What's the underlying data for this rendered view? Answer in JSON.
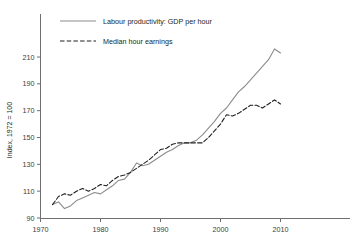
{
  "chart_data": {
    "type": "line",
    "title": "",
    "subtitle": "",
    "xlabel": "",
    "ylabel": "Index, 1972 = 100",
    "xlim": [
      1970,
      2016
    ],
    "ylim": [
      90,
      222
    ],
    "xticks": [
      "1970",
      "1980",
      "1990",
      "2000",
      "2010"
    ],
    "xtick_values": [
      1970,
      1980,
      1990,
      2000,
      2010
    ],
    "yticks": [
      "90",
      "110",
      "130",
      "150",
      "170",
      "190",
      "210"
    ],
    "ytick_values": [
      90,
      110,
      130,
      150,
      170,
      190,
      210
    ],
    "grid": false,
    "legend_position": "top-left-inside",
    "colors": {
      "productivity": "#8c8c8c",
      "earnings": "#231f20",
      "axis": "#6f6f6f",
      "background": "#ffffff"
    },
    "series": [
      {
        "name": "Labour productivity: GDP per hour",
        "style": "solid",
        "color": "#8c8c8c",
        "x": [
          1972,
          1973,
          1974,
          1975,
          1976,
          1977,
          1978,
          1979,
          1980,
          1981,
          1982,
          1983,
          1984,
          1985,
          1986,
          1987,
          1988,
          1989,
          1990,
          1991,
          1992,
          1993,
          1994,
          1995,
          1996,
          1997,
          1998,
          1999,
          2000,
          2001,
          2002,
          2003,
          2004,
          2005,
          2006,
          2007,
          2008,
          2009,
          2010
        ],
        "values": [
          100,
          102,
          97,
          99,
          103,
          105,
          107,
          109,
          108,
          111,
          114,
          118,
          119,
          124,
          131,
          129,
          130,
          133,
          136,
          139,
          141,
          144,
          146,
          146,
          148,
          152,
          157,
          162,
          168,
          172,
          178,
          184,
          188,
          193,
          198,
          203,
          208,
          216,
          213
        ]
      },
      {
        "name": "Median hour earnings",
        "style": "dashed",
        "color": "#231f20",
        "x": [
          1972,
          1973,
          1974,
          1975,
          1976,
          1977,
          1978,
          1979,
          1980,
          1981,
          1982,
          1983,
          1984,
          1985,
          1986,
          1987,
          1988,
          1989,
          1990,
          1991,
          1992,
          1993,
          1994,
          1995,
          1996,
          1997,
          1998,
          1999,
          2000,
          2001,
          2002,
          2003,
          2004,
          2005,
          2006,
          2007,
          2008,
          2009,
          2010
        ],
        "values": [
          100,
          106,
          108,
          107,
          110,
          112,
          110,
          112,
          115,
          114,
          118,
          121,
          122,
          124,
          127,
          130,
          133,
          137,
          141,
          142,
          145,
          146,
          146,
          146,
          146,
          146,
          150,
          155,
          160,
          167,
          166,
          168,
          171,
          174,
          174,
          172,
          175,
          178,
          175
        ]
      }
    ],
    "legend_entries": [
      {
        "label": "Labour productivity: GDP per hour",
        "style": "solid",
        "color": "#8c8c8c"
      },
      {
        "label": "Median hour earnings",
        "style": "dashed",
        "color": "#231f20"
      }
    ]
  }
}
